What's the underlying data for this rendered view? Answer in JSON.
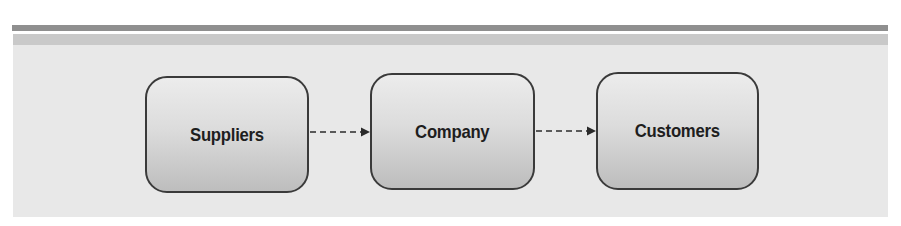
{
  "diagram": {
    "nodes": [
      {
        "id": "suppliers",
        "label": "Suppliers"
      },
      {
        "id": "company",
        "label": "Company"
      },
      {
        "id": "customers",
        "label": "Customers"
      }
    ],
    "edges": [
      {
        "from": "suppliers",
        "to": "company",
        "style": "dashed",
        "arrowhead": "filled-triangle"
      },
      {
        "from": "company",
        "to": "customers",
        "style": "dashed",
        "arrowhead": "filled-triangle"
      }
    ],
    "colors": {
      "panel": "#e8e8e8",
      "rule_dark": "#8f8f8f",
      "rule_light": "#c9c9c9",
      "node_border": "#3a3a3a",
      "text": "#1e1e1e"
    }
  }
}
